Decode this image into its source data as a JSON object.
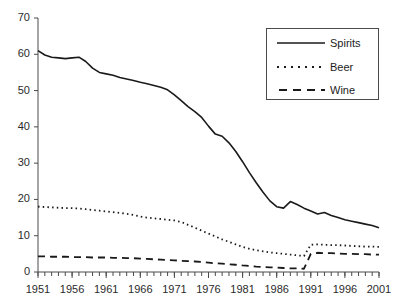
{
  "chart_data": {
    "type": "line",
    "title": "",
    "subtitle": "",
    "xlabel": "",
    "ylabel": "",
    "xlim": [
      1951,
      2001
    ],
    "ylim": [
      0,
      70
    ],
    "yticks": [
      0,
      10,
      20,
      30,
      40,
      50,
      60,
      70
    ],
    "xticks": [
      1951,
      1956,
      1961,
      1966,
      1971,
      1976,
      1981,
      1986,
      1991,
      1996,
      2001
    ],
    "xtick_labels": [
      "1951",
      "1956",
      "1961",
      "1966",
      "1971",
      "1976",
      "1981",
      "1986",
      "1991",
      "1996",
      "2001"
    ],
    "ytick_labels": [
      "0",
      "10",
      "20",
      "30",
      "40",
      "50",
      "60",
      "70"
    ],
    "minor_xticks_annual": true,
    "grid": false,
    "legend_position": "top-right",
    "x": [
      1951,
      1952,
      1953,
      1954,
      1955,
      1956,
      1957,
      1958,
      1959,
      1960,
      1961,
      1962,
      1963,
      1964,
      1965,
      1966,
      1967,
      1968,
      1969,
      1970,
      1971,
      1972,
      1973,
      1974,
      1975,
      1976,
      1977,
      1978,
      1979,
      1980,
      1981,
      1982,
      1983,
      1984,
      1985,
      1986,
      1987,
      1988,
      1989,
      1990,
      1991,
      1992,
      1993,
      1994,
      1995,
      1996,
      1997,
      1998,
      1999,
      2000,
      2001
    ],
    "series": [
      {
        "name": "Spirits",
        "style": "solid",
        "color": "#1a1a1a",
        "values": [
          61.0,
          59.8,
          59.2,
          59.0,
          58.8,
          59.0,
          59.2,
          58.0,
          56.2,
          55.0,
          54.6,
          54.2,
          53.6,
          53.2,
          52.8,
          52.3,
          51.9,
          51.4,
          50.9,
          50.2,
          48.8,
          47.2,
          45.6,
          44.2,
          42.6,
          40.2,
          38.0,
          37.4,
          35.6,
          33.2,
          30.4,
          27.4,
          24.6,
          22.0,
          19.6,
          18.0,
          17.6,
          19.4,
          18.6,
          17.6,
          16.8,
          16.0,
          16.4,
          15.6,
          15.0,
          14.4,
          14.0,
          13.6,
          13.2,
          12.8,
          12.2
        ]
      },
      {
        "name": "Beer",
        "style": "dotted",
        "color": "#1a1a1a",
        "values": [
          18.0,
          17.9,
          17.8,
          17.7,
          17.6,
          17.6,
          17.5,
          17.3,
          17.1,
          16.9,
          16.7,
          16.5,
          16.3,
          16.0,
          15.7,
          15.3,
          15.0,
          14.8,
          14.6,
          14.4,
          14.2,
          13.8,
          13.0,
          12.2,
          11.4,
          10.6,
          9.8,
          9.0,
          8.3,
          7.6,
          6.9,
          6.4,
          6.0,
          5.7,
          5.4,
          5.2,
          5.0,
          4.8,
          4.6,
          4.4,
          7.5,
          7.6,
          7.5,
          7.4,
          7.4,
          7.3,
          7.2,
          7.1,
          7.0,
          7.0,
          6.9
        ]
      },
      {
        "name": "Wine",
        "style": "dashed",
        "color": "#1a1a1a",
        "values": [
          4.3,
          4.3,
          4.2,
          4.2,
          4.2,
          4.1,
          4.1,
          4.1,
          4.0,
          4.0,
          4.0,
          3.9,
          3.9,
          3.8,
          3.8,
          3.7,
          3.6,
          3.5,
          3.4,
          3.3,
          3.2,
          3.1,
          3.0,
          2.9,
          2.8,
          2.6,
          2.4,
          2.3,
          2.1,
          2.0,
          1.8,
          1.7,
          1.5,
          1.4,
          1.3,
          1.2,
          1.1,
          1.0,
          1.0,
          0.9,
          5.0,
          5.3,
          5.2,
          5.2,
          5.1,
          5.0,
          5.0,
          4.9,
          4.9,
          4.8,
          4.8
        ]
      }
    ],
    "legend": [
      {
        "label": "Spirits",
        "style": "solid"
      },
      {
        "label": "Beer",
        "style": "dotted"
      },
      {
        "label": "Wine",
        "style": "dashed"
      }
    ]
  }
}
